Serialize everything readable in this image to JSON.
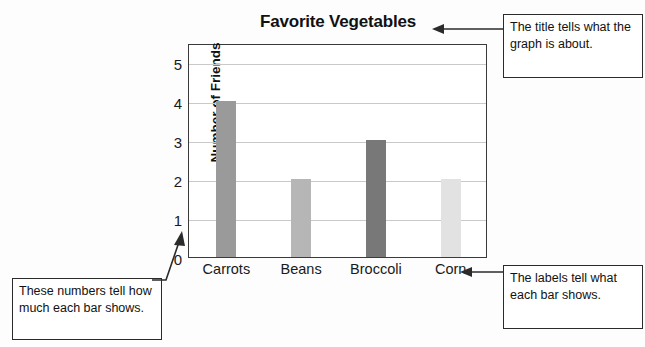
{
  "chart_data": {
    "type": "bar",
    "title": "Favorite Vegetables",
    "xlabel": "",
    "ylabel": "Number of Friends",
    "categories": [
      "Carrots",
      "Beans",
      "Broccoli",
      "Corn"
    ],
    "values": [
      4,
      2,
      3,
      2
    ],
    "yticks": [
      "5",
      "4",
      "3",
      "2",
      "1",
      "0"
    ],
    "ylim": [
      0,
      5.5
    ],
    "grid": true,
    "legend": "none",
    "bar_colors": [
      "#9a9a9a",
      "#b6b6b6",
      "#787878",
      "#e2e2e2"
    ]
  },
  "annotations": {
    "title_note": "The title tells what the graph is about.",
    "numbers_note": "These numbers tell how much each bar shows.",
    "labels_note": "The labels tell what each bar shows."
  },
  "colors": {
    "frame": "#3a3a3a",
    "gridline": "#c9c9c9",
    "callout_border": "#2b2b2b",
    "text": "#111111",
    "background": "#fdfdfd"
  }
}
